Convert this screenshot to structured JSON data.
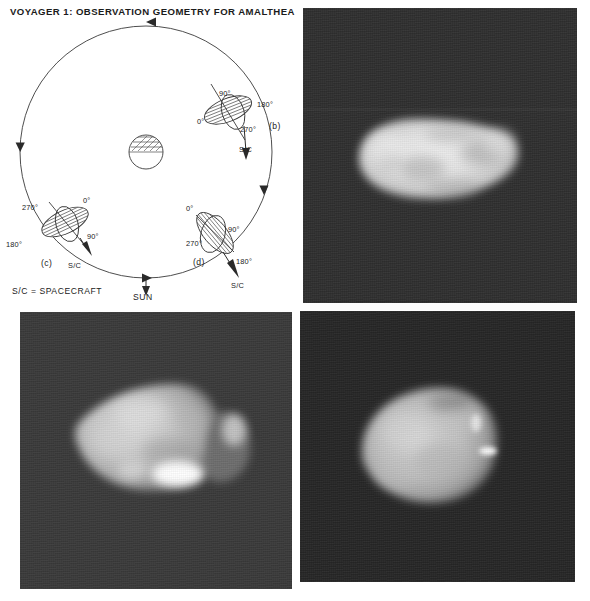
{
  "figure": {
    "title": "VOYAGER 1:  OBSERVATION GEOMETRY FOR AMALTHEA",
    "background_color": "#ffffff",
    "panel_background_color": "#2b2b2b",
    "body_bright_color": "#e8e8e8"
  },
  "diagram": {
    "name": "observation-geometry-diagram",
    "legend": "S/C = SPACECRAFT",
    "sun_label": "SUN",
    "central_body_label": "",
    "orbit": {
      "direction_arrows": [
        "top-left",
        "left-down",
        "bottom-right",
        "right-up"
      ]
    },
    "positions": [
      {
        "id": "b",
        "panel_label": "(b)",
        "sc_label": "S/C",
        "angles": {
          "top": "90°",
          "right": "180°",
          "left": "0°",
          "bottom": "270°"
        }
      },
      {
        "id": "c",
        "panel_label": "(c)",
        "sc_label": "S/C",
        "angles": {
          "top": "0°",
          "right": "90°",
          "left": "270°",
          "bottom": "180°"
        }
      },
      {
        "id": "d",
        "panel_label": "(d)",
        "sc_label": "S/C",
        "angles": {
          "top": "0°",
          "right": "90°",
          "left": "270°",
          "bottom": "180°"
        }
      }
    ]
  },
  "panels": [
    {
      "id": "b",
      "name": "amalthea-image-b",
      "description": "bright elongated oval body, long axis near horizontal, mottled surface"
    },
    {
      "id": "c",
      "name": "amalthea-image-c",
      "description": "irregular wedge shaped body with very bright spot at lower centre and bright crescent at right limb"
    },
    {
      "id": "d",
      "name": "amalthea-image-d",
      "description": "rounded egg shaped body with bright point on right limb"
    }
  ]
}
